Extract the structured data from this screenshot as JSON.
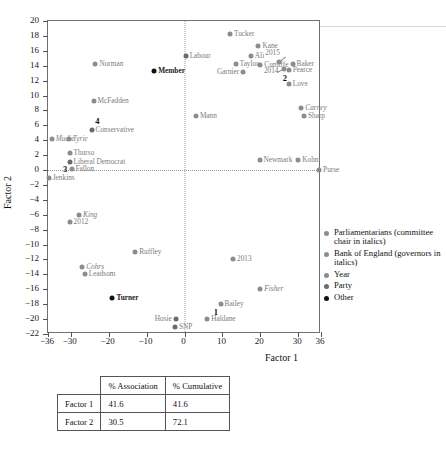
{
  "chart_data": {
    "type": "scatter",
    "title": "",
    "xlabel": "Factor 1",
    "ylabel": "Factor 2",
    "xlim": [
      -36,
      36
    ],
    "ylim": [
      -22,
      20
    ],
    "xticks": [
      -36,
      -30,
      -20,
      -10,
      0,
      10,
      20,
      30,
      36
    ],
    "yticks": [
      20,
      18,
      16,
      14,
      12,
      10,
      8,
      6,
      4,
      2,
      0,
      -2,
      -4,
      -6,
      -8,
      -10,
      -12,
      -14,
      -16,
      -18,
      -20,
      -22
    ],
    "grid": false,
    "zero_lines": true,
    "legend_position": "right",
    "series": [
      {
        "name": "Parliamentarians (committee chair in italics)",
        "category": "parl",
        "color": "#8c8c8c",
        "points": [
          {
            "label": "Tucker",
            "x": 12.0,
            "y": 18.3,
            "side": "right",
            "italic": false
          },
          {
            "label": "Kane",
            "x": 19.5,
            "y": 16.6,
            "side": "right",
            "italic": false
          },
          {
            "label": "Ali",
            "x": 17.5,
            "y": 15.3,
            "side": "right",
            "italic": false
          },
          {
            "label": "Cunliffe",
            "x": 20.0,
            "y": 14.1,
            "side": "right",
            "italic": false
          },
          {
            "label": "Taylor",
            "x": 13.5,
            "y": 14.2,
            "side": "right",
            "italic": false
          },
          {
            "label": "Garnier",
            "x": 15.5,
            "y": 13.2,
            "side": "left",
            "italic": false
          },
          {
            "label": "Baker",
            "x": 28.5,
            "y": 14.2,
            "side": "right",
            "italic": false
          },
          {
            "label": "Pearce",
            "x": 27.5,
            "y": 13.4,
            "side": "right",
            "italic": false
          },
          {
            "label": "Love",
            "x": 27.5,
            "y": 11.5,
            "side": "right",
            "italic": false
          },
          {
            "label": "Norman",
            "x": -23.5,
            "y": 14.2,
            "side": "right",
            "italic": false
          },
          {
            "label": "McFadden",
            "x": -24.0,
            "y": 9.3,
            "side": "right",
            "italic": false
          },
          {
            "label": "Mann",
            "x": 3.0,
            "y": 7.3,
            "side": "right",
            "italic": false
          },
          {
            "label": "Mudie",
            "x": -35.0,
            "y": 4.2,
            "side": "right",
            "italic": true
          },
          {
            "label": "Tyrie",
            "x": -30.5,
            "y": 4.1,
            "side": "right",
            "italic": true
          },
          {
            "label": "Thurso",
            "x": -30.3,
            "y": 2.3,
            "side": "right",
            "italic": false
          },
          {
            "label": "Fallon",
            "x": -29.8,
            "y": 0.2,
            "side": "right",
            "italic": false
          },
          {
            "label": "Jenkins",
            "x": -35.8,
            "y": -1.0,
            "side": "right",
            "italic": false
          },
          {
            "label": "Newmark",
            "x": 19.8,
            "y": 1.3,
            "side": "right",
            "italic": false
          },
          {
            "label": "Kohn",
            "x": 30.0,
            "y": 1.3,
            "side": "right",
            "italic": false
          },
          {
            "label": "Ruffley",
            "x": -13.0,
            "y": -11.0,
            "side": "right",
            "italic": false
          },
          {
            "label": "Cohrs",
            "x": -27.0,
            "y": -13.0,
            "side": "right",
            "italic": true
          },
          {
            "label": "Leadsom",
            "x": -26.3,
            "y": -14.0,
            "side": "right",
            "italic": false
          },
          {
            "label": "Bailey",
            "x": 9.5,
            "y": -18.0,
            "side": "right",
            "italic": false
          },
          {
            "label": "Haldane",
            "x": 6.0,
            "y": -20.0,
            "side": "right",
            "italic": false
          },
          {
            "label": "Fisher",
            "x": 20.0,
            "y": -16.0,
            "side": "right",
            "italic": true
          }
        ]
      },
      {
        "name": "Bank of England (governors in italics)",
        "category": "boe",
        "color": "#8c8c8c",
        "points": [
          {
            "label": "Carney",
            "x": 30.8,
            "y": 8.3,
            "side": "right",
            "italic": true
          },
          {
            "label": "Sharp",
            "x": 31.5,
            "y": 7.2,
            "side": "right",
            "italic": false
          },
          {
            "label": "King",
            "x": -27.8,
            "y": -6.0,
            "side": "right",
            "italic": true
          },
          {
            "label": "Purse",
            "x": 35.5,
            "y": 0.0,
            "side": "right",
            "italic": false
          }
        ]
      },
      {
        "name": "Year",
        "category": "year",
        "color": "#8c8c8c",
        "points": [
          {
            "label": "2015",
            "x": 24.8,
            "y": 14.5,
            "side": "ann-ne",
            "italic": false
          },
          {
            "label": "2014",
            "x": 26.3,
            "y": 13.6,
            "side": "ann-w",
            "italic": false
          },
          {
            "label": "2013",
            "x": 12.8,
            "y": -12.0,
            "side": "right",
            "italic": false
          },
          {
            "label": "2012",
            "x": -30.3,
            "y": -7.0,
            "side": "right",
            "italic": false
          }
        ]
      },
      {
        "name": "Party",
        "category": "party",
        "color": "#6b6b6b",
        "points": [
          {
            "label": "Labour",
            "x": 0.3,
            "y": 15.3,
            "side": "right",
            "italic": false
          },
          {
            "label": "Conservative",
            "x": -24.5,
            "y": 5.4,
            "side": "right",
            "italic": false
          },
          {
            "label": "Liberal Democrat",
            "x": -30.3,
            "y": 1.1,
            "side": "right",
            "italic": false
          },
          {
            "label": "Hosie",
            "x": -2.3,
            "y": -20.0,
            "side": "left",
            "italic": false
          },
          {
            "label": "SNP",
            "x": -2.5,
            "y": -21.0,
            "side": "right",
            "italic": false
          }
        ]
      },
      {
        "name": "Other",
        "category": "other",
        "color": "#111111",
        "points": [
          {
            "label": "Member",
            "x": -8.0,
            "y": 13.3,
            "side": "right",
            "italic": false
          },
          {
            "label": "Turner",
            "x": -19.0,
            "y": -17.2,
            "side": "right",
            "italic": false
          }
        ]
      }
    ],
    "number_annotations": [
      {
        "label": "4",
        "x": -23.0,
        "y": 6.6
      },
      {
        "label": "3",
        "x": -31.5,
        "y": 0.1
      },
      {
        "label": "2",
        "x": 26.5,
        "y": 12.3
      },
      {
        "label": "1",
        "x": 8.3,
        "y": -19.0
      }
    ]
  },
  "legend": {
    "items": [
      {
        "label": "Parliamentarians (committee chair in italics)",
        "color": "#8c8c8c"
      },
      {
        "label": "Bank of England (governors in italics)",
        "color": "#8c8c8c"
      },
      {
        "label": "Year",
        "color": "#8c8c8c"
      },
      {
        "label": "Party",
        "color": "#6b6b6b"
      },
      {
        "label": "Other",
        "color": "#111111"
      }
    ]
  },
  "table": {
    "columns": [
      "",
      "% Association",
      "% Cumulative"
    ],
    "rows": [
      {
        "name": "Factor 1",
        "association": "41.6",
        "cumulative": "41.6"
      },
      {
        "name": "Factor 2",
        "association": "30.5",
        "cumulative": "72.1"
      }
    ]
  }
}
